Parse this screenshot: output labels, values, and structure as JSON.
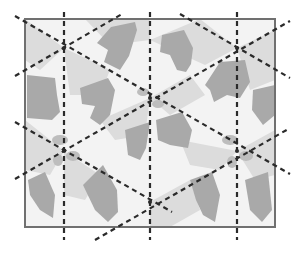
{
  "figure": {
    "colors": {
      "background": "#ffffff",
      "tile_light": "#eeeeee",
      "tile_mid": "#d6d6d6",
      "tile_dark": "#a8a8a8",
      "frame": "#707070",
      "axis": "#2a2a2a"
    },
    "frame": {
      "x": 25,
      "y": 19,
      "width": 250,
      "height": 208
    },
    "vertical_axes_x": [
      64,
      150,
      237
    ],
    "rotation_centers": [
      {
        "x": 64,
        "y": 48
      },
      {
        "x": 237,
        "y": 48
      },
      {
        "x": 150,
        "y": 98
      },
      {
        "x": 64,
        "y": 151
      },
      {
        "x": 237,
        "y": 151
      },
      {
        "x": 150,
        "y": 202
      }
    ],
    "diagonal_axes": [
      {
        "x1": 15,
        "y1": 14,
        "x2": 290,
        "y2": 173
      },
      {
        "x1": 15,
        "y1": 122,
        "x2": 170,
        "y2": 212
      },
      {
        "x1": 180,
        "y1": 14,
        "x2": 290,
        "y2": 78
      },
      {
        "x1": 15,
        "y1": 74,
        "x2": 120,
        "y2": 14
      },
      {
        "x1": 15,
        "y1": 180,
        "x2": 290,
        "y2": 21
      },
      {
        "x1": 95,
        "y1": 240,
        "x2": 290,
        "y2": 127
      }
    ]
  }
}
